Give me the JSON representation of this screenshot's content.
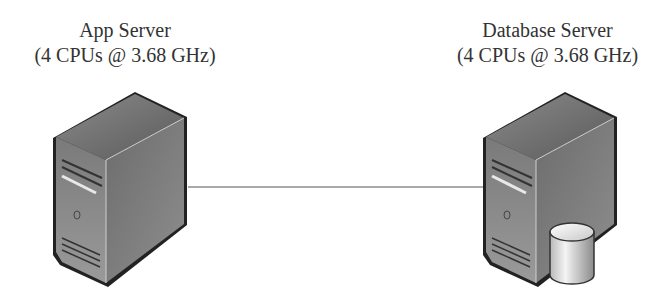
{
  "nodes": [
    {
      "id": "app",
      "title": "App Server",
      "subtitle": "(4 CPUs @ 3.68 GHz)",
      "icon": "server-tower-icon"
    },
    {
      "id": "db",
      "title": "Database Server",
      "subtitle": "(4 CPUs @ 3.68 GHz)",
      "icon": "database-server-icon"
    }
  ],
  "edges": [
    {
      "from": "app",
      "to": "db",
      "style": "solid line"
    }
  ],
  "colors": {
    "line": "#555555",
    "text": "#333333",
    "outline": "#222222"
  }
}
